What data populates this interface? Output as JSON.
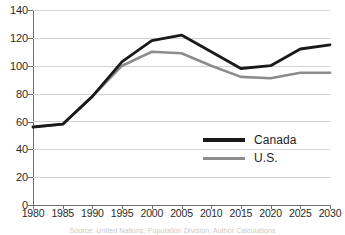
{
  "chart_data": {
    "type": "line",
    "title": "",
    "xlabel": "",
    "ylabel": "",
    "categories": [
      "1980",
      "1985",
      "1990",
      "1995",
      "2000",
      "2005",
      "2010",
      "2015",
      "2020",
      "2025",
      "2030"
    ],
    "ylim": [
      0,
      140
    ],
    "yticks": [
      0,
      20,
      40,
      60,
      80,
      100,
      120,
      140
    ],
    "grid": true,
    "legend_position": "inside-right",
    "series": [
      {
        "name": "Canada",
        "color": "#1a1a1a",
        "values": [
          56,
          58,
          78,
          103,
          118,
          122,
          110,
          98,
          100,
          112,
          115
        ]
      },
      {
        "name": "U.S.",
        "color": "#8c8c8c",
        "values": [
          56,
          58,
          78,
          100,
          110,
          109,
          100,
          92,
          91,
          95,
          95
        ]
      }
    ],
    "source_note": "Source: United Nations, Population Division, Author Calculations"
  },
  "axis": {
    "y_labels": [
      "140",
      "120",
      "100",
      "80",
      "60",
      "40",
      "20",
      "0"
    ],
    "x_labels": [
      "1980",
      "1985",
      "1990",
      "1995",
      "2000",
      "2005",
      "2010",
      "2015",
      "2020",
      "2025",
      "2030"
    ]
  },
  "legend": {
    "items": [
      {
        "label": "Canada",
        "color": "#1a1a1a"
      },
      {
        "label": "U.S.",
        "color": "#8c8c8c"
      }
    ]
  },
  "colors": {
    "canada": "#1a1a1a",
    "us": "#8c8c8c",
    "grid": "#d2d2d2",
    "axis": "#6e6e6e",
    "text": "#2a2a2a",
    "background": "#ffffff"
  }
}
